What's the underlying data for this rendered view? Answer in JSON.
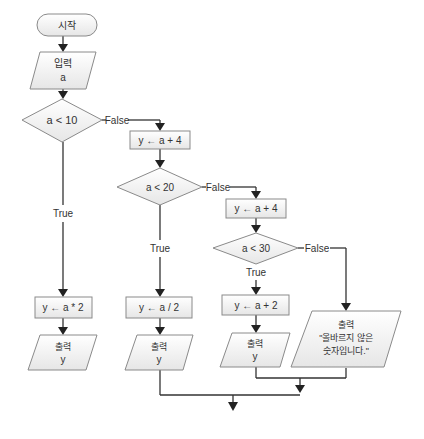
{
  "flowchart": {
    "start": {
      "label": "시작"
    },
    "input": {
      "line1": "입력",
      "line2": "a"
    },
    "decision1": {
      "condition": "a < 10",
      "false_label": "False",
      "true_label": "True"
    },
    "process_false1": {
      "label": "y ← a + 4"
    },
    "decision2": {
      "condition": "a < 20",
      "false_label": "False",
      "true_label": "True"
    },
    "process_false2": {
      "label": "y ← a + 4"
    },
    "decision3": {
      "condition": "a < 30",
      "false_label": "False",
      "true_label": "True"
    },
    "process_true1": {
      "label": "y ← a * 2"
    },
    "process_true2": {
      "label": "y ← a / 2"
    },
    "process_true3": {
      "label": "y ← a + 2"
    },
    "output1": {
      "line1": "출력",
      "line2": "y"
    },
    "output2": {
      "line1": "출력",
      "line2": "y"
    },
    "output3": {
      "line1": "출력",
      "line2": "y"
    },
    "output_error": {
      "line1": "출력",
      "line2": "\"올바르지 않은",
      "line3": "숫자입니다.\""
    }
  },
  "colors": {
    "line": "#333333",
    "shape_border": "#8a8a8a",
    "shape_fill_top": "#ffffff",
    "shape_fill_bottom": "#e8e8e8"
  }
}
